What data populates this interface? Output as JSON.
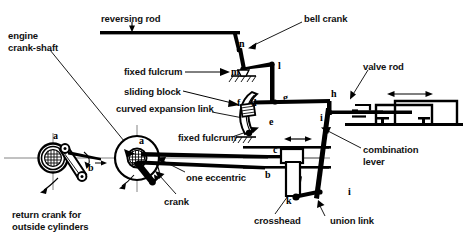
{
  "diagram": {
    "type": "mechanical-linkage-diagram",
    "colors": {
      "ink": "#000000",
      "paper": "#ffffff",
      "thin_rule": "#555555"
    },
    "callouts": [
      {
        "id": "engine-crank-shaft",
        "text": "engine\ncrank-shaft",
        "x": 8,
        "y": 30,
        "align": "left"
      },
      {
        "id": "reversing-rod",
        "text": "reversing rod",
        "x": 101,
        "y": 13,
        "align": "left"
      },
      {
        "id": "bell-crank",
        "text": "bell crank",
        "x": 304,
        "y": 13,
        "align": "left"
      },
      {
        "id": "fixed-fulcrum-upper",
        "text": "fixed fulcrum",
        "x": 124,
        "y": 68,
        "align": "left"
      },
      {
        "id": "sliding-block",
        "text": "sliding block",
        "x": 124,
        "y": 90,
        "align": "left"
      },
      {
        "id": "curved-expansion-link",
        "text": "curved expansion link",
        "x": 116,
        "y": 106,
        "align": "left"
      },
      {
        "id": "fixed-fulcrum-lower",
        "text": "fixed fulcrum",
        "x": 178,
        "y": 136,
        "align": "left"
      },
      {
        "id": "valve-rod",
        "text": "valve rod",
        "x": 363,
        "y": 63,
        "align": "left"
      },
      {
        "id": "combination-lever",
        "text": "combination\nlever",
        "x": 363,
        "y": 145,
        "align": "left"
      },
      {
        "id": "one-eccentric",
        "text": "one eccentric",
        "x": 186,
        "y": 175,
        "align": "left"
      },
      {
        "id": "crank",
        "text": "crank",
        "x": 164,
        "y": 199,
        "align": "left"
      },
      {
        "id": "crosshead",
        "text": "crosshead",
        "x": 254,
        "y": 218,
        "align": "left"
      },
      {
        "id": "union-link",
        "text": "union link",
        "x": 330,
        "y": 218,
        "align": "left"
      },
      {
        "id": "return-crank-for-outside-cylinders",
        "text": "return crank for\noutside cylinders",
        "x": 12,
        "y": 210,
        "align": "left"
      }
    ],
    "part_letters": [
      {
        "id": "letter-a-return-crank",
        "text": "a",
        "x": 53,
        "y": 131
      },
      {
        "id": "letter-b-return-crank",
        "text": "b",
        "x": 88,
        "y": 166
      },
      {
        "id": "letter-a-crank",
        "text": "a",
        "x": 139,
        "y": 136
      },
      {
        "id": "letter-b-expansion",
        "text": "b",
        "x": 265,
        "y": 173
      },
      {
        "id": "letter-c-radius-rod",
        "text": "c",
        "x": 273,
        "y": 148
      },
      {
        "id": "letter-d-link",
        "text": "d",
        "x": 251,
        "y": 101
      },
      {
        "id": "letter-e-link-bottom",
        "text": "e",
        "x": 269,
        "y": 120
      },
      {
        "id": "letter-f-sliding-block",
        "text": "f",
        "x": 244,
        "y": 101
      },
      {
        "id": "letter-g-radius-rod",
        "text": "g",
        "x": 283,
        "y": 96
      },
      {
        "id": "letter-h-valve-rod",
        "text": "h",
        "x": 331,
        "y": 92
      },
      {
        "id": "letter-i-valve-rod-joint",
        "text": "i",
        "x": 320,
        "y": 114
      },
      {
        "id": "letter-i-union-link",
        "text": "i",
        "x": 348,
        "y": 190
      },
      {
        "id": "letter-k-crosshead",
        "text": "k",
        "x": 302,
        "y": 200
      },
      {
        "id": "letter-l-bell-crank",
        "text": "l",
        "x": 278,
        "y": 64
      },
      {
        "id": "letter-m-bell-crank-fulcrum",
        "text": "m",
        "x": 235,
        "y": 71
      },
      {
        "id": "letter-n-bell-crank-top",
        "text": "n",
        "x": 240,
        "y": 45
      }
    ]
  }
}
